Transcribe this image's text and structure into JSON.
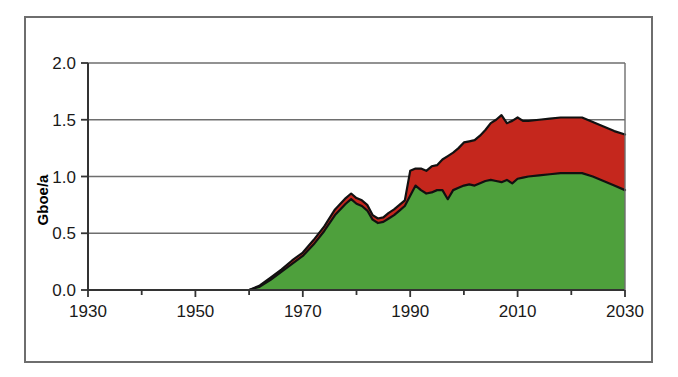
{
  "chart_data": {
    "type": "area",
    "stacked": true,
    "title": "",
    "subtitle": "",
    "xlabel": "",
    "ylabel": "Gboe/a",
    "xlim": [
      1930,
      2030
    ],
    "ylim": [
      0.0,
      2.0
    ],
    "xticks": [
      1930,
      1950,
      1970,
      1990,
      2010,
      2030
    ],
    "xtick_labels": [
      "1930",
      "1950",
      "1970",
      "1990",
      "2010",
      "2030"
    ],
    "x_minor_tick_interval": 10,
    "yticks": [
      0.0,
      0.5,
      1.0,
      1.5,
      2.0
    ],
    "ytick_labels": [
      "0.0",
      "0.5",
      "1.0",
      "1.5",
      "2.0"
    ],
    "grid": "horizontal",
    "legend": "none",
    "colors": {
      "series_lower": "#4ea03c",
      "series_upper": "#c5271d",
      "outline": "#111111",
      "gridline": "#6e6e6e",
      "axis": "#333333",
      "frame": "#6e6e6e",
      "background": "#ffffff"
    },
    "x": [
      1930,
      1935,
      1940,
      1945,
      1950,
      1955,
      1960,
      1962,
      1964,
      1966,
      1968,
      1970,
      1972,
      1974,
      1976,
      1978,
      1979,
      1980,
      1981,
      1982,
      1983,
      1984,
      1985,
      1986,
      1987,
      1988,
      1989,
      1990,
      1991,
      1992,
      1993,
      1994,
      1995,
      1996,
      1997,
      1998,
      1999,
      2000,
      2001,
      2002,
      2003,
      2004,
      2005,
      2006,
      2007,
      2008,
      2009,
      2010,
      2011,
      2012,
      2014,
      2016,
      2018,
      2020,
      2022,
      2024,
      2026,
      2028,
      2030
    ],
    "series": [
      {
        "name": "series_lower",
        "color": "#4ea03c",
        "values": [
          0.0,
          0.0,
          0.0,
          0.0,
          0.0,
          0.0,
          0.0,
          0.03,
          0.09,
          0.16,
          0.23,
          0.3,
          0.4,
          0.52,
          0.66,
          0.76,
          0.8,
          0.76,
          0.74,
          0.7,
          0.62,
          0.59,
          0.6,
          0.63,
          0.66,
          0.7,
          0.74,
          0.83,
          0.92,
          0.88,
          0.85,
          0.86,
          0.88,
          0.88,
          0.8,
          0.88,
          0.9,
          0.92,
          0.93,
          0.92,
          0.94,
          0.96,
          0.97,
          0.96,
          0.95,
          0.97,
          0.94,
          0.98,
          0.99,
          1.0,
          1.01,
          1.02,
          1.03,
          1.03,
          1.03,
          1.0,
          0.96,
          0.92,
          0.88
        ]
      },
      {
        "name": "series_upper",
        "color": "#c5271d",
        "values": [
          0.0,
          0.0,
          0.0,
          0.0,
          0.0,
          0.0,
          0.0,
          0.01,
          0.02,
          0.02,
          0.03,
          0.03,
          0.04,
          0.04,
          0.05,
          0.05,
          0.05,
          0.05,
          0.05,
          0.05,
          0.04,
          0.04,
          0.04,
          0.05,
          0.05,
          0.05,
          0.05,
          0.22,
          0.15,
          0.19,
          0.2,
          0.23,
          0.22,
          0.27,
          0.38,
          0.33,
          0.35,
          0.38,
          0.38,
          0.4,
          0.42,
          0.45,
          0.5,
          0.54,
          0.59,
          0.5,
          0.55,
          0.54,
          0.5,
          0.49,
          0.49,
          0.49,
          0.49,
          0.49,
          0.49,
          0.48,
          0.48,
          0.48,
          0.49
        ]
      }
    ],
    "totals": [
      0.0,
      0.0,
      0.0,
      0.0,
      0.0,
      0.0,
      0.0,
      0.04,
      0.11,
      0.18,
      0.26,
      0.33,
      0.44,
      0.56,
      0.71,
      0.81,
      0.85,
      0.81,
      0.79,
      0.75,
      0.66,
      0.63,
      0.64,
      0.68,
      0.71,
      0.75,
      0.79,
      1.05,
      1.07,
      1.07,
      1.05,
      1.09,
      1.1,
      1.15,
      1.18,
      1.21,
      1.25,
      1.3,
      1.31,
      1.32,
      1.36,
      1.41,
      1.47,
      1.5,
      1.54,
      1.47,
      1.49,
      1.52,
      1.49,
      1.49,
      1.5,
      1.51,
      1.52,
      1.52,
      1.52,
      1.48,
      1.44,
      1.4,
      1.37
    ]
  }
}
